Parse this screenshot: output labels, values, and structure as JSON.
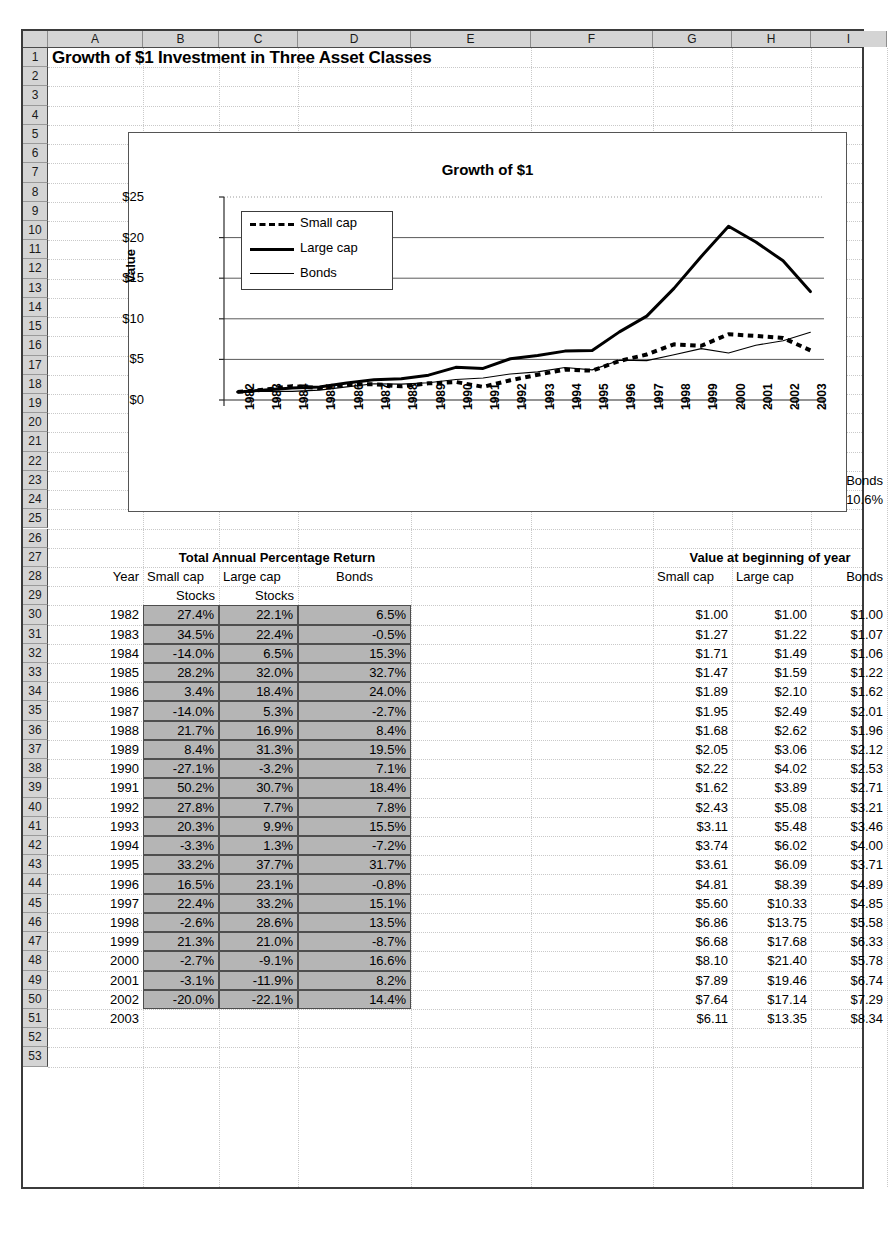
{
  "sheet": {
    "column_headers": [
      "A",
      "B",
      "C",
      "D",
      "E",
      "F",
      "G",
      "H",
      "I"
    ],
    "row_numbers": [
      1,
      2,
      3,
      4,
      5,
      6,
      7,
      8,
      9,
      10,
      11,
      12,
      13,
      14,
      15,
      16,
      17,
      18,
      19,
      20,
      21,
      22,
      23,
      24,
      25,
      26,
      27,
      28,
      29,
      30,
      31,
      32,
      33,
      34,
      35,
      36,
      37,
      38,
      39,
      40,
      41,
      42,
      43,
      44,
      45,
      46,
      47,
      48,
      49,
      50,
      51,
      52,
      53
    ],
    "title": "Growth of $1 Investment in Three Asset Classes",
    "summary_headers": {
      "small_cap": "Small cap",
      "large_cap": "Large cap",
      "bonds": "Bonds"
    },
    "summary_label": "Average annualized return",
    "summary_values": {
      "small_cap": "9.0%",
      "large_cap": "13.1%",
      "bonds": "10.6%"
    },
    "left_table_title": "Total Annual Percentage Return",
    "right_table_title": "Value at beginning of year",
    "left_headers": [
      "Year",
      "Small cap",
      "Large cap",
      "Bonds"
    ],
    "left_subheaders": [
      "Stocks",
      "Stocks"
    ],
    "right_headers": [
      "Small cap",
      "Large cap",
      "Bonds"
    ],
    "rows": [
      {
        "row": 30,
        "year": "1982",
        "small": "27.4%",
        "large": "22.1%",
        "bonds": "6.5%",
        "vsmall": "$1.00",
        "vlarge": "$1.00",
        "vbonds": "$1.00"
      },
      {
        "row": 31,
        "year": "1983",
        "small": "34.5%",
        "large": "22.4%",
        "bonds": "-0.5%",
        "vsmall": "$1.27",
        "vlarge": "$1.22",
        "vbonds": "$1.07"
      },
      {
        "row": 32,
        "year": "1984",
        "small": "-14.0%",
        "large": "6.5%",
        "bonds": "15.3%",
        "vsmall": "$1.71",
        "vlarge": "$1.49",
        "vbonds": "$1.06"
      },
      {
        "row": 33,
        "year": "1985",
        "small": "28.2%",
        "large": "32.0%",
        "bonds": "32.7%",
        "vsmall": "$1.47",
        "vlarge": "$1.59",
        "vbonds": "$1.22"
      },
      {
        "row": 34,
        "year": "1986",
        "small": "3.4%",
        "large": "18.4%",
        "bonds": "24.0%",
        "vsmall": "$1.89",
        "vlarge": "$2.10",
        "vbonds": "$1.62"
      },
      {
        "row": 35,
        "year": "1987",
        "small": "-14.0%",
        "large": "5.3%",
        "bonds": "-2.7%",
        "vsmall": "$1.95",
        "vlarge": "$2.49",
        "vbonds": "$2.01"
      },
      {
        "row": 36,
        "year": "1988",
        "small": "21.7%",
        "large": "16.9%",
        "bonds": "8.4%",
        "vsmall": "$1.68",
        "vlarge": "$2.62",
        "vbonds": "$1.96"
      },
      {
        "row": 37,
        "year": "1989",
        "small": "8.4%",
        "large": "31.3%",
        "bonds": "19.5%",
        "vsmall": "$2.05",
        "vlarge": "$3.06",
        "vbonds": "$2.12"
      },
      {
        "row": 38,
        "year": "1990",
        "small": "-27.1%",
        "large": "-3.2%",
        "bonds": "7.1%",
        "vsmall": "$2.22",
        "vlarge": "$4.02",
        "vbonds": "$2.53"
      },
      {
        "row": 39,
        "year": "1991",
        "small": "50.2%",
        "large": "30.7%",
        "bonds": "18.4%",
        "vsmall": "$1.62",
        "vlarge": "$3.89",
        "vbonds": "$2.71"
      },
      {
        "row": 40,
        "year": "1992",
        "small": "27.8%",
        "large": "7.7%",
        "bonds": "7.8%",
        "vsmall": "$2.43",
        "vlarge": "$5.08",
        "vbonds": "$3.21"
      },
      {
        "row": 41,
        "year": "1993",
        "small": "20.3%",
        "large": "9.9%",
        "bonds": "15.5%",
        "vsmall": "$3.11",
        "vlarge": "$5.48",
        "vbonds": "$3.46"
      },
      {
        "row": 42,
        "year": "1994",
        "small": "-3.3%",
        "large": "1.3%",
        "bonds": "-7.2%",
        "vsmall": "$3.74",
        "vlarge": "$6.02",
        "vbonds": "$4.00"
      },
      {
        "row": 43,
        "year": "1995",
        "small": "33.2%",
        "large": "37.7%",
        "bonds": "31.7%",
        "vsmall": "$3.61",
        "vlarge": "$6.09",
        "vbonds": "$3.71"
      },
      {
        "row": 44,
        "year": "1996",
        "small": "16.5%",
        "large": "23.1%",
        "bonds": "-0.8%",
        "vsmall": "$4.81",
        "vlarge": "$8.39",
        "vbonds": "$4.89"
      },
      {
        "row": 45,
        "year": "1997",
        "small": "22.4%",
        "large": "33.2%",
        "bonds": "15.1%",
        "vsmall": "$5.60",
        "vlarge": "$10.33",
        "vbonds": "$4.85"
      },
      {
        "row": 46,
        "year": "1998",
        "small": "-2.6%",
        "large": "28.6%",
        "bonds": "13.5%",
        "vsmall": "$6.86",
        "vlarge": "$13.75",
        "vbonds": "$5.58"
      },
      {
        "row": 47,
        "year": "1999",
        "small": "21.3%",
        "large": "21.0%",
        "bonds": "-8.7%",
        "vsmall": "$6.68",
        "vlarge": "$17.68",
        "vbonds": "$6.33"
      },
      {
        "row": 48,
        "year": "2000",
        "small": "-2.7%",
        "large": "-9.1%",
        "bonds": "16.6%",
        "vsmall": "$8.10",
        "vlarge": "$21.40",
        "vbonds": "$5.78"
      },
      {
        "row": 49,
        "year": "2001",
        "small": "-3.1%",
        "large": "-11.9%",
        "bonds": "8.2%",
        "vsmall": "$7.89",
        "vlarge": "$19.46",
        "vbonds": "$6.74"
      },
      {
        "row": 50,
        "year": "2002",
        "small": "-20.0%",
        "large": "-22.1%",
        "bonds": "14.4%",
        "vsmall": "$7.64",
        "vlarge": "$17.14",
        "vbonds": "$7.29"
      },
      {
        "row": 51,
        "year": "2003",
        "small": "",
        "large": "",
        "bonds": "",
        "vsmall": "$6.11",
        "vlarge": "$13.35",
        "vbonds": "$8.34"
      }
    ]
  },
  "caption": {
    "label": "FIGURE 2.2",
    "text": ""
  },
  "chart_data": {
    "type": "line",
    "title": "Growth of $1",
    "xlabel": "",
    "ylabel": "Value",
    "ylim": [
      0,
      25
    ],
    "yticks": [
      "$0",
      "$5",
      "$10",
      "$15",
      "$20",
      "$25"
    ],
    "ytick_values": [
      0,
      5,
      10,
      15,
      20,
      25
    ],
    "grid": true,
    "legend_position": "upper-left",
    "x": [
      "1982",
      "1983",
      "1984",
      "1985",
      "1986",
      "1987",
      "1988",
      "1989",
      "1990",
      "1991",
      "1992",
      "1993",
      "1994",
      "1995",
      "1996",
      "1997",
      "1998",
      "1999",
      "2000",
      "2001",
      "2002",
      "2003"
    ],
    "series": [
      {
        "name": "Small cap",
        "style": "dotted",
        "values": [
          1.0,
          1.27,
          1.71,
          1.47,
          1.89,
          1.95,
          1.68,
          2.05,
          2.22,
          1.62,
          2.43,
          3.11,
          3.74,
          3.61,
          4.81,
          5.6,
          6.86,
          6.68,
          8.1,
          7.89,
          7.64,
          6.11
        ]
      },
      {
        "name": "Large cap",
        "style": "thick",
        "values": [
          1.0,
          1.22,
          1.49,
          1.59,
          2.1,
          2.49,
          2.62,
          3.06,
          4.02,
          3.89,
          5.08,
          5.48,
          6.02,
          6.09,
          8.39,
          10.33,
          13.75,
          17.68,
          21.4,
          19.46,
          17.14,
          13.35
        ]
      },
      {
        "name": "Bonds",
        "style": "thin",
        "values": [
          1.0,
          1.07,
          1.06,
          1.22,
          1.62,
          2.01,
          1.96,
          2.12,
          2.53,
          2.71,
          3.21,
          3.46,
          4.0,
          3.71,
          4.89,
          4.85,
          5.58,
          6.33,
          5.78,
          6.74,
          7.29,
          8.34
        ]
      }
    ]
  }
}
